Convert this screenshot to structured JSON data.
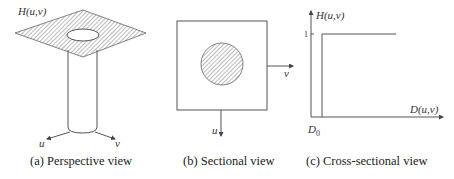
{
  "figure": {
    "panels": [
      {
        "id": "a",
        "caption": "(a) Perspective view",
        "labels": {
          "surface": "H(u,v)",
          "u_axis": "u",
          "v_axis": "v"
        }
      },
      {
        "id": "b",
        "caption": "(b) Sectional view",
        "labels": {
          "u_axis": "u",
          "v_axis": "v"
        }
      },
      {
        "id": "c",
        "caption": "(c) Cross-sectional view",
        "labels": {
          "y_axis": "H(u,v)",
          "x_axis": "D(u,v)",
          "y_tick": "1",
          "x_tick": "D",
          "x_tick_sub": "0"
        }
      }
    ]
  },
  "colors": {
    "line": "#555555",
    "hatch": "#777777",
    "text": "#222222",
    "background": "#ffffff"
  }
}
